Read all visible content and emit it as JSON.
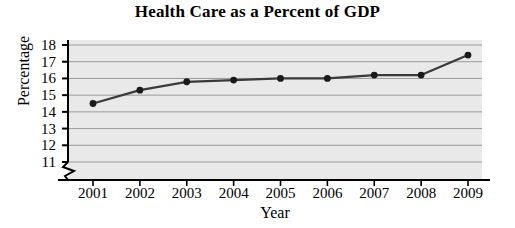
{
  "chart_data": {
    "type": "line",
    "title": "Health Care as a Percent of GDP",
    "xlabel": "Year",
    "ylabel": "Percentage",
    "categories": [
      "2001",
      "2002",
      "2003",
      "2004",
      "2005",
      "2006",
      "2007",
      "2008",
      "2009"
    ],
    "values": [
      14.5,
      15.3,
      15.8,
      15.9,
      16.0,
      16.0,
      16.2,
      16.2,
      17.4
    ],
    "series": [
      {
        "name": "Health care percent of GDP",
        "values": [
          14.5,
          15.3,
          15.8,
          15.9,
          16.0,
          16.0,
          16.2,
          16.2,
          17.4
        ]
      }
    ],
    "ylim": [
      11,
      18
    ],
    "yticks": [
      "11",
      "12",
      "13",
      "14",
      "15",
      "16",
      "17",
      "18"
    ],
    "ytick_values": [
      11,
      12,
      13,
      14,
      15,
      16,
      17,
      18
    ],
    "xticks": [
      "2001",
      "2002",
      "2003",
      "2004",
      "2005",
      "2006",
      "2007",
      "2008",
      "2009"
    ],
    "axis_break": true,
    "grid": true,
    "grid_axis": "y",
    "legend": "none",
    "plot_background_color": "#e9e9e9",
    "line_color": "#3a3a3a",
    "marker_color": "#1a1a1a",
    "grid_color": "#9a9a9a",
    "axis_color": "#000000",
    "marker": "circle"
  }
}
